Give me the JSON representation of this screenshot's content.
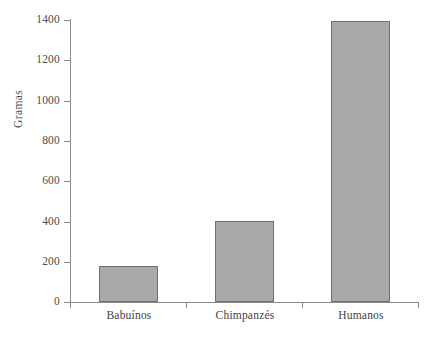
{
  "chart_data": {
    "type": "bar",
    "title": "",
    "subtitle": "",
    "xlabel": "",
    "ylabel": "Gramas",
    "categories": [
      "Babuínos",
      "Chimpanzés",
      "Humanos"
    ],
    "values": [
      180,
      400,
      1395
    ],
    "ylim": [
      0,
      1400
    ],
    "yticks": [
      0,
      200,
      400,
      600,
      800,
      1000,
      1200,
      1400
    ],
    "ytick_labels": [
      "0",
      "200",
      "400",
      "600",
      "800",
      "1000",
      "1200",
      "1400"
    ],
    "grid": false,
    "legend": null,
    "legend_position": "none",
    "bar_fill_color": "#a9a9a9",
    "bar_edge_color": "#6f6f6f",
    "axis_color": "#8a8a8a",
    "text_color": "#4d4d4d",
    "background_color": "#ffffff",
    "annotations": []
  }
}
